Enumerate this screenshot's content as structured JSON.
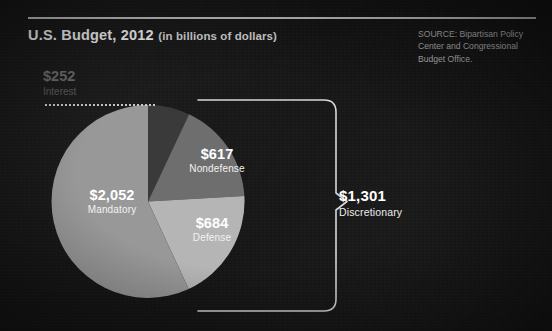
{
  "header": {
    "title_main": "U.S. Budget, 2012",
    "title_sub": "(in billions of dollars)"
  },
  "source": {
    "text": "SOURCE: Bipartisan Policy Center and Congressional Budget Office."
  },
  "callout": {
    "value": "$1,301",
    "name": "Discretionary"
  },
  "colors": {
    "background": "#151515",
    "interest": "#3a3a3a",
    "nondefense": "#6e6e6e",
    "defense": "#b5b5b5",
    "mandatory": "#989898",
    "rule": "#cfcfcf",
    "bracket": "#d8d8d8",
    "label_light": "#ffffff",
    "label_dim": "#6d6d6d"
  },
  "chart_data": {
    "type": "pie",
    "title": "U.S. Budget, 2012",
    "subtitle": "(in billions of dollars)",
    "units": "billions of dollars",
    "total": 3605,
    "start_angle": 0,
    "direction": "clockwise",
    "legend": "none",
    "labels": [
      "Interest",
      "Nondefense",
      "Defense",
      "Mandatory"
    ],
    "values": [
      252,
      617,
      684,
      2052
    ],
    "value_labels": [
      "$252",
      "$617",
      "$684",
      "$2,052"
    ],
    "slices": [
      {
        "name": "Interest",
        "value": 252,
        "value_label": "$252",
        "color": "#3a3a3a",
        "angle_deg": 25.2,
        "label_placement": "outside-top-left",
        "dimmed": true
      },
      {
        "name": "Nondefense",
        "value": 617,
        "value_label": "$617",
        "color": "#6e6e6e",
        "angle_deg": 61.6,
        "label_placement": "inside",
        "dimmed": false
      },
      {
        "name": "Defense",
        "value": 684,
        "value_label": "$684",
        "color": "#b5b5b5",
        "angle_deg": 68.3,
        "label_placement": "inside",
        "dimmed": false
      },
      {
        "name": "Mandatory",
        "value": 2052,
        "value_label": "$2,052",
        "color": "#989898",
        "angle_deg": 204.9,
        "label_placement": "inside",
        "dimmed": false
      }
    ],
    "annotations": [
      {
        "type": "bracket",
        "label": "Discretionary",
        "value": 1301,
        "value_label": "$1,301",
        "groups": [
          "Nondefense",
          "Defense"
        ]
      },
      {
        "type": "leader-line",
        "style": "dotted",
        "label": "Interest",
        "value_label": "$252"
      }
    ]
  }
}
